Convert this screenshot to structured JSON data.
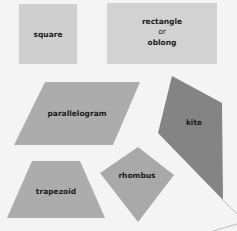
{
  "diagram": {
    "background": "#f4f4f4",
    "shapes": [
      {
        "id": "square",
        "label": "square",
        "fill": "#cfcfcf"
      },
      {
        "id": "rectangle",
        "label_lines": [
          "rectangle",
          "or",
          "oblong"
        ],
        "fill": "#d2d2d2"
      },
      {
        "id": "parallelogram",
        "label": "parallelogram",
        "fill": "#acacac"
      },
      {
        "id": "kite",
        "label": "kite",
        "fill": "#848484"
      },
      {
        "id": "trapezoid",
        "label": "trapezoid",
        "fill": "#acacac"
      },
      {
        "id": "rhombus",
        "label": "rhombus",
        "fill": "#a9a9a9"
      }
    ]
  }
}
